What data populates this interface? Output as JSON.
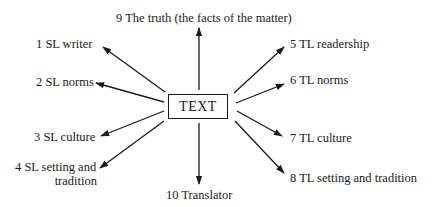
{
  "diagram": {
    "center": {
      "label": "TEXT"
    },
    "nodes": [
      {
        "id": 1,
        "label": "1  SL writer"
      },
      {
        "id": 2,
        "label": "2  SL norms"
      },
      {
        "id": 3,
        "label": "3  SL culture"
      },
      {
        "id": 4,
        "label_line1": "4  SL setting and",
        "label_line2": "tradition"
      },
      {
        "id": 5,
        "label": "5  TL readership"
      },
      {
        "id": 6,
        "label": "6  TL norms"
      },
      {
        "id": 7,
        "label": "7  TL culture"
      },
      {
        "id": 8,
        "label": "8  TL setting and tradition"
      },
      {
        "id": 9,
        "label": "9  The truth (the facts of the matter)"
      },
      {
        "id": 10,
        "label": "10  Translator"
      }
    ],
    "edge_color": "#1a1a1a",
    "background": "#ffffff"
  }
}
